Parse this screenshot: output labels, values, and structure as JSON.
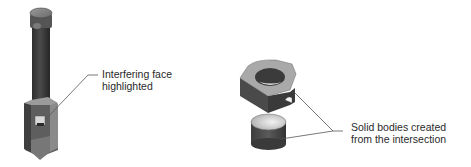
{
  "diagram": {
    "left_figure": {
      "name": "Shaft and bracket assembly",
      "callout": {
        "line1": "Interfering face",
        "line2": "highlighted"
      }
    },
    "right_figure": {
      "name": "Resulting solid bodies",
      "callout": {
        "line1": "Solid bodies created",
        "line2": "from the intersection"
      }
    },
    "colors": {
      "dark_body": "#3a3a3a",
      "mid_body": "#6b6b6b",
      "light_face": "#b5b5b5",
      "highlight_face": "#d8d8d8",
      "leader_line": "#555555",
      "text": "#2a2a2a"
    }
  }
}
